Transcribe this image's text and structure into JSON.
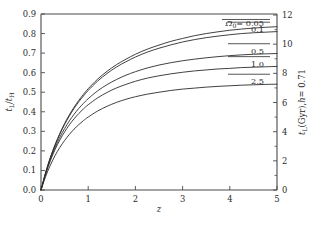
{
  "chart_data": {
    "type": "line",
    "title": "",
    "subtitle": "",
    "xlabel": "z",
    "ylabel": "t_L/t_H",
    "ylabel_right": "t_L (Gyr), h = 0.71",
    "xlim": [
      0,
      5
    ],
    "ylim": [
      0,
      0.9
    ],
    "ylim_right": [
      0,
      12
    ],
    "grid": false,
    "legend_position": "inline-annotations",
    "xticks": [
      0,
      1,
      2,
      3,
      4,
      5
    ],
    "xticklabels": [
      "0",
      "1",
      "2",
      "3",
      "4",
      "5"
    ],
    "yticks": [
      0.0,
      0.1,
      0.2,
      0.3,
      0.4,
      0.5,
      0.6,
      0.7,
      0.8,
      0.9
    ],
    "yticklabels": [
      "0.0",
      "0.1",
      "0.2",
      "0.3",
      "0.4",
      "0.5",
      "0.6",
      "0.7",
      "0.8",
      "0.9"
    ],
    "yticks_right": [
      0,
      2,
      4,
      6,
      8,
      10,
      12
    ],
    "yticklabels_right": [
      "0",
      "2",
      "4",
      "6",
      "8",
      "10",
      "12"
    ],
    "yminorticks_right": [
      1,
      3,
      5,
      7,
      9,
      11
    ],
    "x": [
      0,
      0.1,
      0.2,
      0.3,
      0.4,
      0.5,
      0.6,
      0.7,
      0.8,
      0.9,
      1.0,
      1.2,
      1.4,
      1.6,
      1.8,
      2.0,
      2.25,
      2.5,
      2.75,
      3.0,
      3.25,
      3.5,
      3.75,
      4.0,
      4.25,
      4.5,
      4.75,
      5.0
    ],
    "series": [
      {
        "name": "0.05",
        "label": "0.05",
        "param": "Omega_0 = 0.05",
        "values": [
          0.0,
          0.091,
          0.168,
          0.233,
          0.29,
          0.34,
          0.384,
          0.423,
          0.458,
          0.489,
          0.518,
          0.567,
          0.607,
          0.641,
          0.669,
          0.694,
          0.72,
          0.741,
          0.76,
          0.775,
          0.789,
          0.8,
          0.809,
          0.817,
          0.823,
          0.828,
          0.832,
          0.835
        ]
      },
      {
        "name": "0.1",
        "label": "0.1",
        "param": "Omega_0 = 0.1",
        "values": [
          0.0,
          0.09,
          0.166,
          0.23,
          0.286,
          0.335,
          0.378,
          0.417,
          0.451,
          0.481,
          0.509,
          0.557,
          0.596,
          0.629,
          0.656,
          0.68,
          0.705,
          0.725,
          0.742,
          0.757,
          0.769,
          0.779,
          0.787,
          0.794,
          0.8,
          0.804,
          0.807,
          0.81
        ]
      },
      {
        "name": "0.5",
        "label": "0.5",
        "param": "Omega_0 = 0.5",
        "values": [
          0.0,
          0.086,
          0.158,
          0.218,
          0.27,
          0.314,
          0.353,
          0.387,
          0.417,
          0.443,
          0.467,
          0.507,
          0.539,
          0.565,
          0.587,
          0.605,
          0.624,
          0.639,
          0.651,
          0.661,
          0.669,
          0.676,
          0.682,
          0.687,
          0.691,
          0.694,
          0.696,
          0.698
        ]
      },
      {
        "name": "1.0",
        "label": "1.0",
        "param": "Omega_0 = 1.0",
        "values": [
          0.0,
          0.082,
          0.151,
          0.208,
          0.256,
          0.297,
          0.333,
          0.364,
          0.391,
          0.415,
          0.436,
          0.471,
          0.499,
          0.522,
          0.54,
          0.556,
          0.572,
          0.584,
          0.594,
          0.602,
          0.609,
          0.614,
          0.619,
          0.622,
          0.626,
          0.628,
          0.63,
          0.632
        ]
      },
      {
        "name": "2.5",
        "label": "2.5",
        "param": "Omega_0 = 2.5",
        "values": [
          0.0,
          0.07,
          0.128,
          0.177,
          0.218,
          0.253,
          0.284,
          0.311,
          0.334,
          0.355,
          0.373,
          0.404,
          0.428,
          0.448,
          0.464,
          0.477,
          0.49,
          0.5,
          0.509,
          0.516,
          0.521,
          0.526,
          0.53,
          0.533,
          0.536,
          0.538,
          0.54,
          0.541
        ]
      }
    ],
    "annotations": [
      {
        "text": "0.05",
        "prefix": "Omega_0 =",
        "x": 5.0,
        "y": 0.835
      },
      {
        "text": "0.1",
        "prefix": "",
        "x": 5.0,
        "y": 0.81
      },
      {
        "text": "0.5",
        "prefix": "",
        "x": 5.0,
        "y": 0.698
      },
      {
        "text": "1.0",
        "prefix": "",
        "x": 5.0,
        "y": 0.632
      },
      {
        "text": "2.5",
        "prefix": "",
        "x": 5.0,
        "y": 0.541
      }
    ],
    "colors": {
      "line": "#2b2b2b",
      "axis": "#4a4a4a",
      "background": "#ffffff"
    }
  },
  "labels": {
    "omega_symbol": "Ω",
    "omega_sub": "0",
    "equals_005": "= 0.05",
    "t_symbol": "t",
    "sub_L": "L",
    "slash": "/",
    "sub_H": "H",
    "right_axis_gyr": "(Gyr),",
    "right_axis_h": "h",
    "right_axis_hval": "= 0.71",
    "xaxis_z": "z"
  }
}
